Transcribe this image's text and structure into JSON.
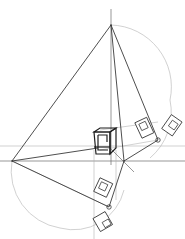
{
  "diagram": {
    "type": "perspective-construction",
    "points": {
      "apex": [
        111,
        25
      ],
      "apex_top": [
        111,
        9
      ],
      "left_vp": [
        12,
        161
      ],
      "center_vp": [
        124,
        161
      ],
      "right_station": [
        158,
        140
      ],
      "bottom_station": [
        109,
        207
      ]
    },
    "colors": {
      "line_dark": "#3a3a3a",
      "line_light": "#b4b4b4",
      "arc": "#bdbdbd",
      "cube": "#1e1e1e",
      "background": "#ffffff"
    }
  }
}
